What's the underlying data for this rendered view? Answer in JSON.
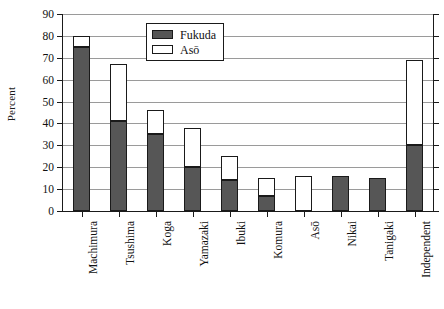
{
  "chart_data": {
    "type": "bar",
    "subtype": "stacked-vertical",
    "title": "",
    "xlabel": "",
    "ylabel": "Percent",
    "ylim": [
      0,
      90
    ],
    "ytick_step": 10,
    "yticks": [
      0,
      10,
      20,
      30,
      40,
      50,
      60,
      70,
      80,
      90
    ],
    "ytick_labels": [
      "0",
      "10",
      "20",
      "30",
      "40",
      "50",
      "60",
      "70",
      "80",
      "90"
    ],
    "grid": "horizontal",
    "legend_position": "top-center",
    "categories": [
      "Machimura",
      "Tsushima",
      "Koga",
      "Yamazaki",
      "Ibuki",
      "Komura",
      "Asō",
      "Nikai",
      "Tanigaki",
      "Independent"
    ],
    "series": [
      {
        "name": "Fukuda",
        "color": "#565656",
        "values": [
          75,
          41,
          35,
          20,
          14,
          7,
          0,
          16,
          15,
          30
        ]
      },
      {
        "name": "Asō",
        "color": "#ffffff",
        "values": [
          5,
          26,
          11,
          18,
          11,
          8,
          16,
          0,
          0,
          39
        ]
      }
    ],
    "totals": [
      80,
      67,
      46,
      38,
      25,
      15,
      16,
      16,
      15,
      69
    ]
  },
  "legend": {
    "items": [
      {
        "label": "Fukuda",
        "swatch": "fukuda-swatch"
      },
      {
        "label": "Asō",
        "swatch": "aso-swatch"
      }
    ]
  }
}
